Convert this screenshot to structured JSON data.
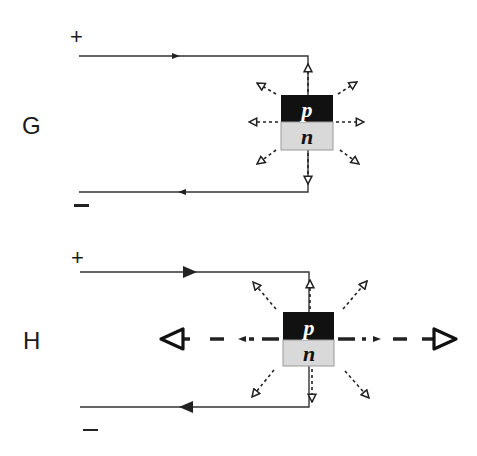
{
  "diagram": {
    "panels": [
      {
        "id": "G",
        "label": "G",
        "positive_terminal": "+",
        "negative_terminal": "−",
        "junction": {
          "top_layer": "p",
          "bottom_layer": "n"
        },
        "emission": "small dashed arrows radiating in all directions (spontaneous emission)"
      },
      {
        "id": "H",
        "label": "H",
        "positive_terminal": "+",
        "negative_terminal": "−",
        "junction": {
          "top_layer": "p",
          "bottom_layer": "n"
        },
        "emission": "small dashed radiating arrows plus strong horizontal dashed beam with large arrowheads (stimulated emission)"
      }
    ],
    "colors": {
      "wire": "#333333",
      "p_layer": "#111111",
      "n_layer": "#d9d9d9",
      "p_text": "#ffffff",
      "n_text": "#111111"
    }
  }
}
